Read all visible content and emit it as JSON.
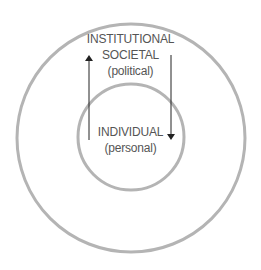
{
  "diagram": {
    "outer_circle": {
      "labels": [
        "INSTITUTIONAL",
        "SOCIETAL",
        "(political)"
      ],
      "stroke_color": "#b4b4b4"
    },
    "inner_circle": {
      "labels": [
        "INDIVIDUAL",
        "(personal)"
      ],
      "stroke_color": "#b4b4b4"
    },
    "arrows": [
      {
        "direction": "up",
        "from": "inner",
        "to": "outer"
      },
      {
        "direction": "down",
        "from": "outer",
        "to": "inner"
      }
    ],
    "arrow_color": "#222222",
    "text_color": "#555555"
  }
}
